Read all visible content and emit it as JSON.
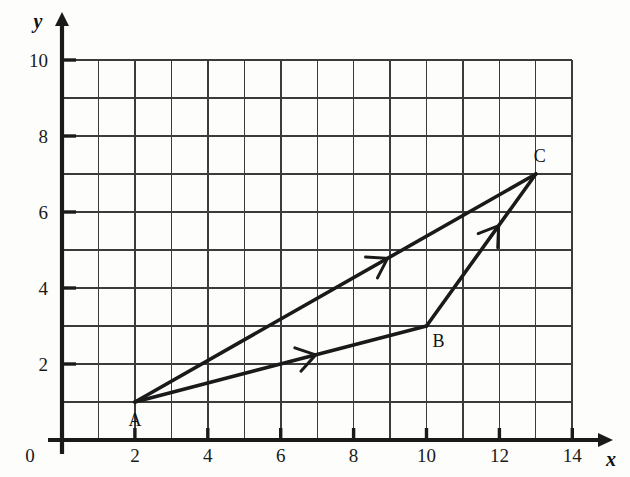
{
  "figure": {
    "title": "",
    "background_color": "#fdfdfb",
    "ink_color": "#1a1a1a",
    "grid_color": "#3b3b3b"
  },
  "axes": {
    "x_name": "x",
    "y_name": "y",
    "origin_label": "0",
    "x_ticks": [
      "2",
      "4",
      "6",
      "8",
      "10",
      "12",
      "14"
    ],
    "y_ticks": [
      "2",
      "4",
      "6",
      "8",
      "10"
    ],
    "x_range": [
      0,
      14
    ],
    "y_range": [
      0,
      10
    ],
    "x_minor_step": 1,
    "y_minor_step": 1
  },
  "chart_data": {
    "type": "scatter",
    "title": "",
    "xlabel": "x",
    "ylabel": "y",
    "xlim": [
      0,
      14
    ],
    "ylim": [
      0,
      10
    ],
    "grid": true,
    "legend": "none",
    "points": [
      {
        "name": "A",
        "label": "A",
        "x": 2,
        "y": 1
      },
      {
        "name": "B",
        "label": "B",
        "x": 10,
        "y": 3
      },
      {
        "name": "C",
        "label": "C",
        "x": 13,
        "y": 7
      }
    ],
    "vectors": [
      {
        "name": "A-to-B",
        "from": "A",
        "to": "B",
        "x1": 2,
        "y1": 1,
        "x2": 10,
        "y2": 3,
        "arrow_at": 0.62
      },
      {
        "name": "B-to-C",
        "from": "B",
        "to": "C",
        "x1": 10,
        "y1": 3,
        "x2": 13,
        "y2": 7,
        "arrow_at": 0.66
      },
      {
        "name": "A-to-C",
        "from": "A",
        "to": "C",
        "x1": 2,
        "y1": 1,
        "x2": 13,
        "y2": 7,
        "arrow_at": 0.63
      }
    ]
  },
  "labels": {
    "a": "A",
    "b": "B",
    "c": "C"
  }
}
